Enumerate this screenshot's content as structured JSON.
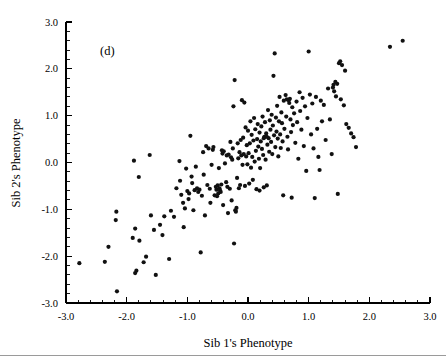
{
  "figure": {
    "panel_label": "(d)",
    "panel_label_x": 100,
    "panel_label_y": 55
  },
  "chart_data": {
    "type": "scatter",
    "title": "",
    "xlabel": "Sib 1's Phenotype",
    "ylabel": "Sib 2's Phenotype",
    "xlim": [
      -3.0,
      3.0
    ],
    "ylim": [
      -3.0,
      3.0
    ],
    "xticks": [
      -3.0,
      -2.0,
      -1.0,
      0.0,
      1.0,
      2.0,
      3.0
    ],
    "yticks": [
      -3.0,
      -2.0,
      -1.0,
      0.0,
      1.0,
      2.0,
      3.0
    ],
    "xtick_labels": [
      "-3.0",
      "-2.0",
      "-1.0",
      "0.0",
      "1.0",
      "2.0",
      "3.0"
    ],
    "ytick_labels": [
      "-3.0",
      "-2.0",
      "-1.0",
      "0.0",
      "1.0",
      "2.0",
      "3.0"
    ],
    "minor_ticks_per_interval": 4,
    "grid": false,
    "legend": null,
    "marker": "filled-circle",
    "marker_color": "#111111",
    "marker_size_px": 2.1,
    "n_points": 232,
    "points": [
      [
        -2.78,
        -2.15
      ],
      [
        -2.36,
        -2.12
      ],
      [
        -2.3,
        -1.8
      ],
      [
        -2.17,
        -1.05
      ],
      [
        -2.18,
        -1.23
      ],
      [
        -2.16,
        -2.75
      ],
      [
        -1.88,
        0.04
      ],
      [
        -1.86,
        -2.36
      ],
      [
        -1.84,
        -2.31
      ],
      [
        -1.86,
        -1.41
      ],
      [
        -1.9,
        -1.61
      ],
      [
        -1.8,
        -0.31
      ],
      [
        -1.79,
        -1.67
      ],
      [
        -1.72,
        -2.13
      ],
      [
        -1.68,
        -2.01
      ],
      [
        -1.62,
        0.16
      ],
      [
        -1.6,
        -1.13
      ],
      [
        -1.55,
        -1.44
      ],
      [
        -1.52,
        -2.4
      ],
      [
        -1.45,
        -1.33
      ],
      [
        -1.41,
        -1.55
      ],
      [
        -1.38,
        -1.15
      ],
      [
        -1.3,
        -2.06
      ],
      [
        -1.27,
        -1.03
      ],
      [
        -1.13,
        0.03
      ],
      [
        -1.12,
        -0.39
      ],
      [
        -1.1,
        -0.69
      ],
      [
        -1.07,
        -0.86
      ],
      [
        -1.06,
        -1.38
      ],
      [
        -1.04,
        -0.98
      ],
      [
        -1.02,
        -0.13
      ],
      [
        -1.0,
        -0.61
      ],
      [
        -0.98,
        -0.78
      ],
      [
        -0.97,
        -0.66
      ],
      [
        -0.95,
        0.57
      ],
      [
        -0.93,
        -0.3
      ],
      [
        -0.92,
        -0.44
      ],
      [
        -0.9,
        -1.02
      ],
      [
        -0.88,
        -0.59
      ],
      [
        -0.86,
        -0.09
      ],
      [
        -0.84,
        -0.55
      ],
      [
        -0.82,
        -0.63
      ],
      [
        -0.8,
        -0.58
      ],
      [
        -0.78,
        -1.92
      ],
      [
        -0.76,
        -0.71
      ],
      [
        -0.74,
        0.22
      ],
      [
        -0.73,
        -0.26
      ],
      [
        -0.71,
        -1.13
      ],
      [
        -0.69,
        0.35
      ],
      [
        -0.67,
        -0.48
      ],
      [
        -0.65,
        0.3
      ],
      [
        -0.63,
        -0.56
      ],
      [
        -0.62,
        -0.86
      ],
      [
        -0.6,
        -0.05
      ],
      [
        -0.58,
        0.27
      ],
      [
        -0.57,
        0.33
      ],
      [
        -0.55,
        -0.7
      ],
      [
        -0.53,
        -0.52
      ],
      [
        -0.52,
        -0.58
      ],
      [
        -0.5,
        -0.49
      ],
      [
        -0.48,
        -0.12
      ],
      [
        -0.47,
        -0.55
      ],
      [
        -0.46,
        -0.6
      ],
      [
        -0.45,
        -0.63
      ],
      [
        -0.44,
        -0.47
      ],
      [
        -0.43,
        0.26
      ],
      [
        -0.42,
        0.19
      ],
      [
        -0.41,
        -0.91
      ],
      [
        -0.4,
        0.24
      ],
      [
        -0.38,
        -0.02
      ],
      [
        -0.36,
        -0.42
      ],
      [
        -0.35,
        0.15
      ],
      [
        -0.33,
        -1.08
      ],
      [
        -0.32,
        0.17
      ],
      [
        -0.3,
        -0.56
      ],
      [
        -0.29,
        0.44
      ],
      [
        -0.28,
        0.11
      ],
      [
        -0.27,
        -0.81
      ],
      [
        -0.26,
        0.06
      ],
      [
        -0.25,
        0.3
      ],
      [
        -0.24,
        1.2
      ],
      [
        -0.23,
        -1.73
      ],
      [
        -0.22,
        1.76
      ],
      [
        -0.21,
        -1.02
      ],
      [
        -0.2,
        -1.05
      ],
      [
        -0.19,
        -0.97
      ],
      [
        -0.18,
        -0.33
      ],
      [
        -0.17,
        0.41
      ],
      [
        -0.16,
        0.09
      ],
      [
        -0.15,
        -0.55
      ],
      [
        -0.14,
        0.22
      ],
      [
        -0.13,
        -0.48
      ],
      [
        -0.12,
        0.48
      ],
      [
        -0.11,
        0.15
      ],
      [
        -0.1,
        1.33
      ],
      [
        -0.09,
        -0.05
      ],
      [
        -0.08,
        0.53
      ],
      [
        -0.07,
        0.18
      ],
      [
        -0.06,
        1.28
      ],
      [
        -0.05,
        -0.5
      ],
      [
        -0.04,
        0.75
      ],
      [
        -0.03,
        0.13
      ],
      [
        -0.02,
        0.37
      ],
      [
        -0.01,
        -0.04
      ],
      [
        0.0,
        0.68
      ],
      [
        0.01,
        0.2
      ],
      [
        0.02,
        -0.45
      ],
      [
        0.03,
        0.41
      ],
      [
        0.04,
        0.88
      ],
      [
        0.05,
        -0.11
      ],
      [
        0.06,
        0.59
      ],
      [
        0.07,
        0.12
      ],
      [
        0.08,
        -0.37
      ],
      [
        0.09,
        0.47
      ],
      [
        0.1,
        0.95
      ],
      [
        0.11,
        0.02
      ],
      [
        0.12,
        0.71
      ],
      [
        0.13,
        0.25
      ],
      [
        0.14,
        -0.57
      ],
      [
        0.15,
        0.5
      ],
      [
        0.16,
        0.82
      ],
      [
        0.17,
        0.34
      ],
      [
        0.18,
        0.08
      ],
      [
        0.19,
        0.64
      ],
      [
        0.2,
        -0.12
      ],
      [
        0.21,
        0.45
      ],
      [
        0.22,
        0.77
      ],
      [
        0.23,
        0.29
      ],
      [
        0.24,
        0.98
      ],
      [
        0.25,
        0.16
      ],
      [
        0.26,
        -0.53
      ],
      [
        0.27,
        0.55
      ],
      [
        0.28,
        0.86
      ],
      [
        0.29,
        0.06
      ],
      [
        0.3,
        0.62
      ],
      [
        0.31,
        -0.49
      ],
      [
        0.32,
        0.38
      ],
      [
        0.33,
        1.12
      ],
      [
        0.34,
        0.52
      ],
      [
        0.35,
        0.23
      ],
      [
        0.36,
        0.9
      ],
      [
        0.37,
        0.7
      ],
      [
        0.38,
        0.44
      ],
      [
        0.39,
        1.02
      ],
      [
        0.4,
        0.18
      ],
      [
        0.41,
        0.79
      ],
      [
        0.42,
        1.85
      ],
      [
        0.43,
        0.58
      ],
      [
        0.44,
        2.33
      ],
      [
        0.45,
        0.33
      ],
      [
        0.46,
        0.96
      ],
      [
        0.47,
        0.66
      ],
      [
        0.48,
        1.21
      ],
      [
        0.49,
        0.51
      ],
      [
        0.5,
        0.13
      ],
      [
        0.51,
        0.88
      ],
      [
        0.52,
        1.4
      ],
      [
        0.53,
        0.6
      ],
      [
        0.54,
        0.31
      ],
      [
        0.55,
        1.07
      ],
      [
        0.56,
        0.84
      ],
      [
        0.57,
        0.45
      ],
      [
        0.58,
        -0.7
      ],
      [
        0.59,
        1.32
      ],
      [
        0.6,
        0.72
      ],
      [
        0.62,
        1.44
      ],
      [
        0.63,
        0.98
      ],
      [
        0.64,
        1.35
      ],
      [
        0.65,
        0.55
      ],
      [
        0.66,
        0.28
      ],
      [
        0.68,
        1.27
      ],
      [
        0.7,
        0.92
      ],
      [
        0.71,
        0.65
      ],
      [
        0.72,
        -0.75
      ],
      [
        0.73,
        1.18
      ],
      [
        0.74,
        0.8
      ],
      [
        0.76,
        1.05
      ],
      [
        0.78,
        0.42
      ],
      [
        0.8,
        1.3
      ],
      [
        0.81,
        0.86
      ],
      [
        0.83,
        0.08
      ],
      [
        0.85,
        1.5
      ],
      [
        0.86,
        1.1
      ],
      [
        0.88,
        0.7
      ],
      [
        0.9,
        1.38
      ],
      [
        0.92,
        0.35
      ],
      [
        0.94,
        1.2
      ],
      [
        0.96,
        -0.18
      ],
      [
        0.98,
        0.95
      ],
      [
        1.0,
        2.37
      ],
      [
        1.02,
        1.45
      ],
      [
        1.04,
        0.6
      ],
      [
        1.06,
        1.26
      ],
      [
        1.08,
        0.3
      ],
      [
        1.1,
        -0.76
      ],
      [
        1.12,
        1.4
      ],
      [
        1.14,
        0.72
      ],
      [
        1.16,
        0.12
      ],
      [
        1.18,
        -0.16
      ],
      [
        1.2,
        1.32
      ],
      [
        1.22,
        0.88
      ],
      [
        1.25,
        1.23
      ],
      [
        1.28,
        0.48
      ],
      [
        1.32,
        1.58
      ],
      [
        1.35,
        0.92
      ],
      [
        1.38,
        0.18
      ],
      [
        1.4,
        1.6
      ],
      [
        1.42,
        1.52
      ],
      [
        1.45,
        1.41
      ],
      [
        1.47,
        1.68
      ],
      [
        1.48,
        -0.67
      ],
      [
        1.5,
        2.12
      ],
      [
        1.52,
        2.16
      ],
      [
        1.53,
        1.35
      ],
      [
        1.55,
        2.08
      ],
      [
        1.58,
        1.22
      ],
      [
        1.6,
        1.96
      ],
      [
        1.62,
        0.82
      ],
      [
        1.66,
        0.74
      ],
      [
        1.7,
        0.62
      ],
      [
        1.74,
        0.54
      ],
      [
        1.78,
        0.33
      ],
      [
        2.34,
        2.47
      ],
      [
        2.55,
        2.6
      ],
      [
        -1.22,
        -1.16
      ],
      [
        -1.18,
        -0.55
      ],
      [
        0.67,
        1.33
      ],
      [
        0.69,
        1.36
      ],
      [
        -0.49,
        -0.66
      ],
      [
        -0.51,
        -0.72
      ],
      [
        0.31,
        0.55
      ],
      [
        0.26,
        0.52
      ],
      [
        -0.34,
        -0.52
      ],
      [
        1.41,
        1.66
      ],
      [
        1.44,
        1.72
      ],
      [
        0.19,
        -0.6
      ]
    ]
  },
  "footer": {
    "rule_color": "#9a9a9a"
  }
}
